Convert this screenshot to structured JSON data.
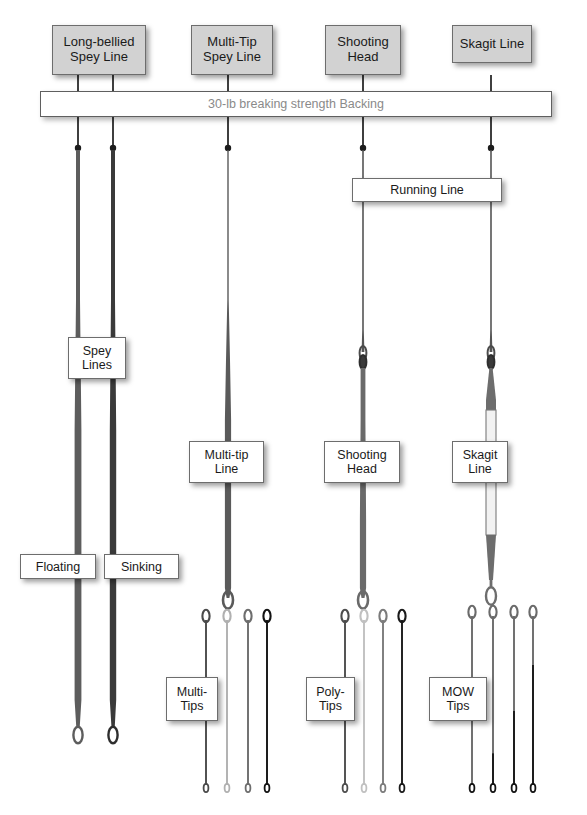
{
  "diagram": {
    "backing": {
      "text": "30-lb breaking strength Backing"
    },
    "top_labels": [
      {
        "id": "long-bellied-spey-line",
        "line1": "Long-bellied",
        "line2": "Spey Line"
      },
      {
        "id": "multi-tip-spey-line",
        "line1": "Multi-Tip",
        "line2": "Spey Line"
      },
      {
        "id": "shooting-head",
        "line1": "Shooting",
        "line2": "Head"
      },
      {
        "id": "skagit-line",
        "line1": "Skagit Line",
        "line2": ""
      }
    ],
    "mid_labels": [
      {
        "id": "running-line",
        "line1": "Running Line",
        "line2": ""
      },
      {
        "id": "spey-lines",
        "line1": "Spey",
        "line2": "Lines"
      },
      {
        "id": "multi-tip-line",
        "line1": "Multi-tip",
        "line2": "Line"
      },
      {
        "id": "shooting-head-segment",
        "line1": "Shooting",
        "line2": "Head"
      },
      {
        "id": "skagit-line-segment",
        "line1": "Skagit",
        "line2": "Line"
      },
      {
        "id": "floating",
        "line1": "Floating",
        "line2": ""
      },
      {
        "id": "sinking",
        "line1": "Sinking",
        "line2": ""
      }
    ],
    "tip_labels": [
      {
        "id": "multi-tips",
        "line1": "Multi-",
        "line2": "Tips"
      },
      {
        "id": "poly-tips",
        "line1": "Poly-",
        "line2": "Tips"
      },
      {
        "id": "mow-tips",
        "line1": "MOW",
        "line2": "Tips"
      }
    ],
    "colors": {
      "line_dark": "#3f3f3f",
      "line_mid": "#6b6b6b",
      "line_light": "#b4b4b4",
      "line_black": "#151515",
      "backing_text": "#8a8a8a",
      "box_gray": "#d2d2d2",
      "box_white": "#ffffff",
      "border": "#6d6d6d"
    },
    "columns": [
      {
        "id": "floating-spey",
        "x": 78
      },
      {
        "id": "sinking-spey",
        "x": 113
      },
      {
        "id": "multi-tip",
        "x": 228
      },
      {
        "id": "shooting-head",
        "x": 363
      },
      {
        "id": "skagit",
        "x": 491
      }
    ],
    "tip_groups": [
      {
        "id": "multi-tips",
        "count": 4,
        "xs": [
          206,
          227,
          248,
          267
        ],
        "top": 612,
        "bottom": 785,
        "shades": [
          "#4a4a4a",
          "#b0b0b0",
          "#6d6d6d",
          "#121212"
        ],
        "two_tone": false
      },
      {
        "id": "poly-tips",
        "count": 4,
        "xs": [
          345,
          364,
          383,
          402
        ],
        "top": 612,
        "bottom": 785,
        "shades": [
          "#4d4d4d",
          "#c0c0c0",
          "#7b7b7b",
          "#1a1a1a"
        ],
        "two_tone": false
      },
      {
        "id": "mow-tips",
        "count": 4,
        "xs": [
          472,
          493,
          514,
          533
        ],
        "top": 608,
        "bottom": 785,
        "shades": [
          "#6a6a6a",
          "#6a6a6a",
          "#6a6a6a",
          "#6a6a6a"
        ],
        "two_tone": true,
        "splits": [
          1.0,
          0.82,
          0.58,
          0.32
        ],
        "dark": "#121212"
      }
    ]
  }
}
